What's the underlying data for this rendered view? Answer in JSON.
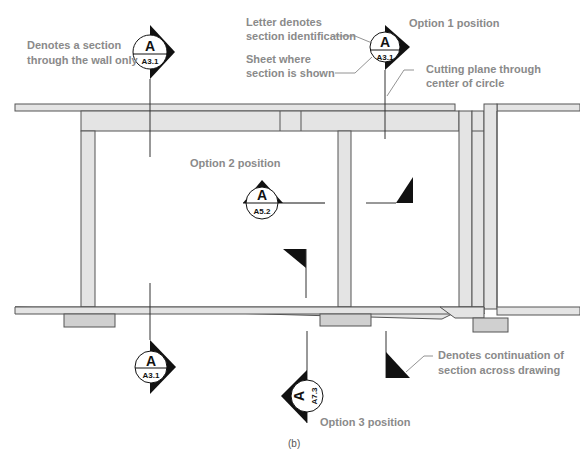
{
  "figure": {
    "caption": "(b)",
    "colors": {
      "wall_fill": "#e4e4e4",
      "footing_fill": "#d0d0d0",
      "annotation_text": "#8a8a8a",
      "symbol_fill": "#111111"
    }
  },
  "annotations": {
    "wall_only": {
      "line1": "Denotes a section",
      "line2": "through the wall only"
    },
    "letter": {
      "line1": "Letter denotes",
      "line2": "section identification"
    },
    "sheet": {
      "line1": "Sheet where",
      "line2": "section is shown"
    },
    "option1": "Option 1 position",
    "cutting_plane": {
      "line1": "Cutting plane through",
      "line2": "center of circle"
    },
    "option2": "Option 2 position",
    "continuation": {
      "line1": "Denotes continuation of",
      "line2": "section across drawing"
    },
    "option3": "Option 3 position"
  },
  "symbols": [
    {
      "id": "wall-top",
      "letter": "A",
      "sheet": "A3.1"
    },
    {
      "id": "option1",
      "letter": "A",
      "sheet": "A3.1"
    },
    {
      "id": "option2",
      "letter": "A",
      "sheet": "A5.2"
    },
    {
      "id": "wall-bottom",
      "letter": "A",
      "sheet": "A3.1"
    },
    {
      "id": "option3",
      "letter": "A",
      "sheet": "A7.3"
    }
  ]
}
